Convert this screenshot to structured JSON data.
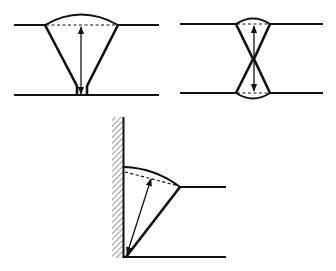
{
  "diagram": {
    "colors": {
      "line": "#111111",
      "background": "#ffffff"
    },
    "figures": [
      {
        "id": "single-v-butt-weld",
        "type": "single V butt weld",
        "top_plate_y": 25,
        "bottom_plate_y": 95,
        "throat_arrow": "double-headed, from root to weld face line"
      },
      {
        "id": "double-v-butt-weld",
        "type": "double V (X) butt weld",
        "top_plate_y": 24,
        "bottom_plate_y": 93,
        "throat_arrow": "double-headed, through full plate thickness"
      },
      {
        "id": "fillet-weld",
        "type": "fillet / bevel weld against wall",
        "wall": "hatched vertical surface",
        "throat_arrow": "double-headed, from root to dashed face line"
      }
    ]
  }
}
